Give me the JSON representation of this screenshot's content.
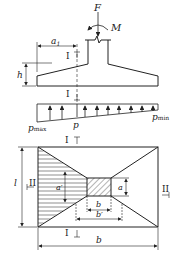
{
  "figure": {
    "labels": {
      "force": "F",
      "moment": "M",
      "a1": "a",
      "a1_sub": "1",
      "height": "h",
      "p_max": "p",
      "p_max_sub": "max",
      "p": "p",
      "p_min": "p",
      "p_min_sub": "min",
      "length": "l",
      "width": "b",
      "a_prime": "a′",
      "a": "a",
      "b_col": "b",
      "b_prime": "b′",
      "section_I": "I",
      "section_II": "II"
    },
    "colors": {
      "line": "#222222",
      "hatch": "#444444",
      "background": "#ffffff"
    }
  }
}
